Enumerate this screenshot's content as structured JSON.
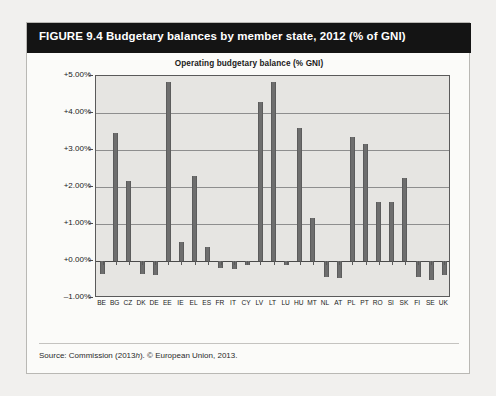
{
  "figure": {
    "banner_title": "FIGURE 9.4  Budgetary balances by member state, 2012 (% of GNI)",
    "source": "Source: Commission (2013h). © European Union, 2013."
  },
  "chart_data": {
    "type": "bar",
    "title": "Operating budgetary balance (% GNI)",
    "xlabel": "",
    "ylabel": "",
    "ylim": [
      -1.0,
      5.0
    ],
    "ytick_labels": [
      "+5.00%",
      "+4.00%",
      "+3.00%",
      "+2.00%",
      "+1.00%",
      "+0.00%",
      "–1.00%"
    ],
    "ytick_values": [
      5.0,
      4.0,
      3.0,
      2.0,
      1.0,
      0.0,
      -1.0
    ],
    "grid": true,
    "legend": "none",
    "categories": [
      "BE",
      "BG",
      "CZ",
      "DK",
      "DE",
      "EE",
      "IE",
      "EL",
      "ES",
      "FR",
      "IT",
      "CY",
      "LV",
      "LT",
      "LU",
      "HU",
      "MT",
      "NL",
      "AT",
      "PL",
      "PT",
      "RO",
      "SI",
      "SK",
      "FI",
      "SE",
      "UK"
    ],
    "values": [
      -0.35,
      3.45,
      2.15,
      -0.35,
      -0.38,
      4.85,
      0.52,
      2.3,
      0.38,
      -0.18,
      -0.22,
      -0.1,
      4.3,
      4.85,
      -0.12,
      3.6,
      1.15,
      -0.42,
      -0.45,
      3.35,
      3.15,
      1.6,
      1.6,
      2.25,
      -0.42,
      -0.5,
      -0.38
    ]
  }
}
